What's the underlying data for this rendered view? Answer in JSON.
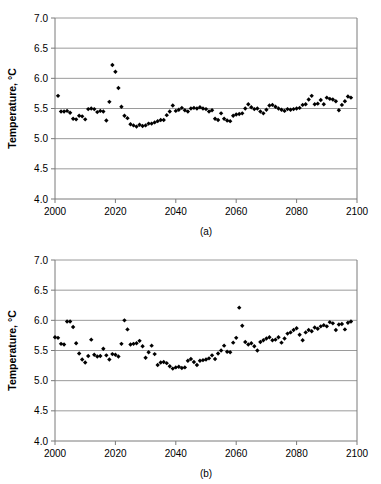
{
  "figure": {
    "background": "#ffffff",
    "marker_color": "#000000",
    "grid_color": "#9a9a9a",
    "axis_color": "#7a7a7a"
  },
  "chart_data": [
    {
      "type": "scatter",
      "panel_label": "(a)",
      "title": "",
      "xlabel": "",
      "ylabel": "Temperature, °C",
      "xlim": [
        2000,
        2100
      ],
      "ylim": [
        4.0,
        7.0
      ],
      "xticks": [
        2000,
        2020,
        2040,
        2060,
        2080,
        2100
      ],
      "yticks": [
        4.0,
        4.5,
        5.0,
        5.5,
        6.0,
        6.5,
        7.0
      ],
      "ytick_labels": [
        "4.0",
        "4.5",
        "5.0",
        "5.5",
        "6.0",
        "6.5",
        "7.0"
      ],
      "xtick_labels": [
        "2000",
        "2020",
        "2040",
        "2060",
        "2080",
        "2100"
      ],
      "grid": true,
      "grid_axis": "y",
      "legend": "none",
      "marker": "diamond",
      "x": [
        2001,
        2002,
        2003,
        2004,
        2005,
        2006,
        2007,
        2008,
        2009,
        2010,
        2011,
        2012,
        2013,
        2014,
        2015,
        2016,
        2017,
        2018,
        2019,
        2020,
        2021,
        2022,
        2023,
        2024,
        2025,
        2026,
        2027,
        2028,
        2029,
        2030,
        2031,
        2032,
        2033,
        2034,
        2035,
        2036,
        2037,
        2038,
        2039,
        2040,
        2041,
        2042,
        2043,
        2044,
        2045,
        2046,
        2047,
        2048,
        2049,
        2050,
        2051,
        2052,
        2053,
        2054,
        2055,
        2056,
        2057,
        2058,
        2059,
        2060,
        2061,
        2062,
        2063,
        2064,
        2065,
        2066,
        2067,
        2068,
        2069,
        2070,
        2071,
        2072,
        2073,
        2074,
        2075,
        2076,
        2077,
        2078,
        2079,
        2080,
        2081,
        2082,
        2083,
        2084,
        2085,
        2086,
        2087,
        2088,
        2089,
        2090,
        2091,
        2092,
        2093,
        2094,
        2095,
        2096,
        2097,
        2098
      ],
      "y": [
        5.71,
        5.45,
        5.45,
        5.46,
        5.43,
        5.33,
        5.32,
        5.38,
        5.37,
        5.32,
        5.49,
        5.5,
        5.49,
        5.44,
        5.46,
        5.45,
        5.3,
        5.61,
        6.22,
        6.11,
        5.84,
        5.53,
        5.38,
        5.34,
        5.24,
        5.22,
        5.2,
        5.23,
        5.21,
        5.22,
        5.25,
        5.25,
        5.27,
        5.29,
        5.31,
        5.31,
        5.39,
        5.45,
        5.55,
        5.46,
        5.48,
        5.51,
        5.47,
        5.45,
        5.5,
        5.51,
        5.5,
        5.52,
        5.5,
        5.49,
        5.45,
        5.47,
        5.33,
        5.31,
        5.42,
        5.33,
        5.3,
        5.29,
        5.38,
        5.4,
        5.41,
        5.42,
        5.5,
        5.57,
        5.52,
        5.49,
        5.5,
        5.45,
        5.42,
        5.48,
        5.55,
        5.56,
        5.53,
        5.5,
        5.48,
        5.46,
        5.49,
        5.48,
        5.49,
        5.5,
        5.51,
        5.56,
        5.57,
        5.65,
        5.71,
        5.57,
        5.58,
        5.64,
        5.57,
        5.68,
        5.66,
        5.65,
        5.62,
        5.47,
        5.56,
        5.62,
        5.7,
        5.68
      ]
    },
    {
      "type": "scatter",
      "panel_label": "(b)",
      "title": "",
      "xlabel": "",
      "ylabel": "Temperature, °C",
      "xlim": [
        2000,
        2100
      ],
      "ylim": [
        4.0,
        7.0
      ],
      "xticks": [
        2000,
        2020,
        2040,
        2060,
        2080,
        2100
      ],
      "yticks": [
        4.0,
        4.5,
        5.0,
        5.5,
        6.0,
        6.5,
        7.0
      ],
      "ytick_labels": [
        "4.0",
        "4.5",
        "5.0",
        "5.5",
        "6.0",
        "6.5",
        "7.0"
      ],
      "xtick_labels": [
        "2000",
        "2020",
        "2040",
        "2060",
        "2080",
        "2100"
      ],
      "grid": true,
      "grid_axis": "y",
      "legend": "none",
      "marker": "diamond",
      "x": [
        2000,
        2001,
        2002,
        2003,
        2004,
        2005,
        2006,
        2007,
        2008,
        2009,
        2010,
        2011,
        2012,
        2013,
        2014,
        2015,
        2016,
        2017,
        2018,
        2019,
        2020,
        2021,
        2022,
        2023,
        2024,
        2025,
        2026,
        2027,
        2028,
        2029,
        2030,
        2031,
        2032,
        2033,
        2034,
        2035,
        2036,
        2037,
        2038,
        2039,
        2040,
        2041,
        2042,
        2043,
        2044,
        2045,
        2046,
        2047,
        2048,
        2049,
        2050,
        2051,
        2052,
        2053,
        2054,
        2055,
        2056,
        2057,
        2058,
        2059,
        2060,
        2061,
        2062,
        2063,
        2064,
        2065,
        2066,
        2067,
        2068,
        2069,
        2070,
        2071,
        2072,
        2073,
        2074,
        2075,
        2076,
        2077,
        2078,
        2079,
        2080,
        2081,
        2082,
        2083,
        2084,
        2085,
        2086,
        2087,
        2088,
        2089,
        2090,
        2091,
        2092,
        2093,
        2094,
        2095,
        2096,
        2097,
        2098
      ],
      "y": [
        5.72,
        5.71,
        5.61,
        5.6,
        5.98,
        5.98,
        5.89,
        5.62,
        5.45,
        5.35,
        5.3,
        5.41,
        5.68,
        5.43,
        5.4,
        5.41,
        5.53,
        5.42,
        5.35,
        5.44,
        5.43,
        5.4,
        5.61,
        6.0,
        5.85,
        5.6,
        5.61,
        5.62,
        5.66,
        5.57,
        5.38,
        5.47,
        5.58,
        5.44,
        5.26,
        5.3,
        5.31,
        5.29,
        5.24,
        5.2,
        5.22,
        5.23,
        5.21,
        5.22,
        5.33,
        5.36,
        5.31,
        5.26,
        5.33,
        5.34,
        5.35,
        5.37,
        5.42,
        5.36,
        5.45,
        5.5,
        5.58,
        5.48,
        5.47,
        5.63,
        5.71,
        6.21,
        5.91,
        5.64,
        5.6,
        5.62,
        5.57,
        5.5,
        5.64,
        5.67,
        5.7,
        5.72,
        5.67,
        5.68,
        5.72,
        5.63,
        5.7,
        5.78,
        5.8,
        5.84,
        5.87,
        5.76,
        5.67,
        5.8,
        5.84,
        5.82,
        5.88,
        5.86,
        5.9,
        5.92,
        5.9,
        5.97,
        5.95,
        5.84,
        5.93,
        5.94,
        5.85,
        5.96,
        5.98
      ]
    }
  ]
}
